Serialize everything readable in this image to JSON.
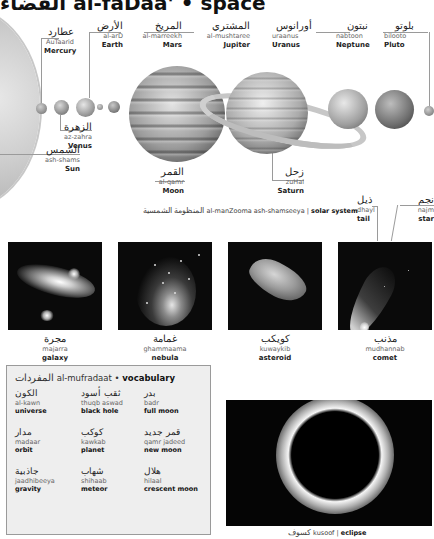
{
  "header": {
    "title_ar": "الفضاء",
    "title_translit": "al-faDaa'",
    "title_sep": "•",
    "title_en": "space"
  },
  "solar_system": {
    "caption_ar": "المنظومة الشمسية",
    "caption_translit": "al-manZooma ash-shamseeya",
    "caption_sep": "|",
    "caption_en": "solar system",
    "bodies": {
      "mercury": {
        "ar": "عطارد",
        "tr": "AuTaarid",
        "en": "Mercury"
      },
      "earth": {
        "ar": "الأرض",
        "tr": "al-arD",
        "en": "Earth"
      },
      "mars": {
        "ar": "المريخ",
        "tr": "al-marreekh",
        "en": "Mars"
      },
      "jupiter": {
        "ar": "المشتري",
        "tr": "al-mushtaree",
        "en": "Jupiter"
      },
      "uranus": {
        "ar": "أورانوس",
        "tr": "uraanus",
        "en": "Uranus"
      },
      "neptune": {
        "ar": "نبتون",
        "tr": "nabtoon",
        "en": "Neptune"
      },
      "pluto": {
        "ar": "بلوتو",
        "tr": "bilooto",
        "en": "Pluto"
      },
      "venus": {
        "ar": "الزهرة",
        "tr": "az-zahra",
        "en": "Venus"
      },
      "sun": {
        "ar": "الشمس",
        "tr": "ash-shams",
        "en": "Sun"
      },
      "moon": {
        "ar": "القمر",
        "tr": "al-qamr",
        "en": "Moon"
      },
      "saturn": {
        "ar": "زحل",
        "tr": "zuHal",
        "en": "Saturn"
      }
    }
  },
  "comet_labels": {
    "tail": {
      "ar": "ذيل",
      "tr": "dhayl",
      "en": "tail"
    },
    "star": {
      "ar": "نجم",
      "tr": "najm",
      "en": "star"
    }
  },
  "photos": [
    {
      "ar": "مجرة",
      "tr": "majarra",
      "en": "galaxy"
    },
    {
      "ar": "غمامة",
      "tr": "ghammaama",
      "en": "nebula"
    },
    {
      "ar": "كويكب",
      "tr": "kuwaykib",
      "en": "asteroid"
    },
    {
      "ar": "مذنب",
      "tr": "mudhannab",
      "en": "comet"
    }
  ],
  "vocabulary": {
    "title_ar": "المفردات",
    "title_translit": "al-mufradaat",
    "title_sep": "•",
    "title_en": "vocabulary",
    "items": [
      {
        "ar": "الكون",
        "tr": "al-kawn",
        "en": "universe"
      },
      {
        "ar": "ثقب أسود",
        "tr": "thuqb aswad",
        "en": "black hole"
      },
      {
        "ar": "بدر",
        "tr": "badr",
        "en": "full moon"
      },
      {
        "ar": "مدار",
        "tr": "madaar",
        "en": "orbit"
      },
      {
        "ar": "كوكب",
        "tr": "kawkab",
        "en": "planet"
      },
      {
        "ar": "قمر جديد",
        "tr": "qamr jadeed",
        "en": "new moon"
      },
      {
        "ar": "جاذبية",
        "tr": "jaadhibeeya",
        "en": "gravity"
      },
      {
        "ar": "شهاب",
        "tr": "shihaab",
        "en": "meteor"
      },
      {
        "ar": "هلال",
        "tr": "hilaal",
        "en": "crescent moon"
      }
    ]
  },
  "eclipse": {
    "ar": "كسوف",
    "tr": "kusoof",
    "sep": "|",
    "en": "eclipse"
  }
}
